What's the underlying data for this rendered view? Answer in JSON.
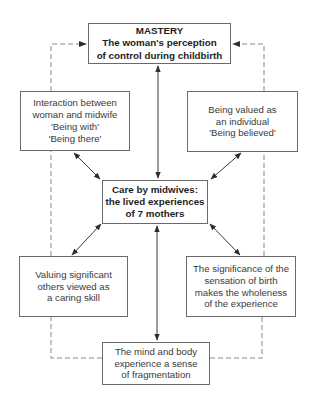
{
  "diagram": {
    "colors": {
      "box_border": "#6a6a6a",
      "solid_arrow": "#3a3a3a",
      "dashed_line": "#8a8a8a",
      "background": "#ffffff"
    },
    "nodes": {
      "mastery": {
        "lines": [
          "MASTERY",
          "The woman's perception",
          "of control during childbirth"
        ],
        "bold": true
      },
      "interaction": {
        "lines": [
          "Interaction between",
          "woman and midwife",
          "'Being with'",
          "'Being there'"
        ]
      },
      "valued": {
        "lines": [
          "Being valued as",
          "an individual",
          "'Being believed'"
        ]
      },
      "care": {
        "lines": [
          "Care by midwives:",
          "the lived experiences",
          "of 7 mothers"
        ],
        "bold": true
      },
      "significant_others": {
        "lines": [
          "Valuing significant",
          "others viewed as",
          "a caring skill"
        ]
      },
      "sensation": {
        "lines": [
          "The significance of the",
          "sensation of birth",
          "makes the wholeness",
          "of the experience"
        ]
      },
      "fragmentation": {
        "lines": [
          "The mind and body",
          "experience a sense",
          "of fragmentation"
        ]
      }
    },
    "edges": [
      {
        "from": "care",
        "to": "mastery",
        "style": "solid",
        "arrows": "both"
      },
      {
        "from": "care",
        "to": "fragmentation",
        "style": "solid",
        "arrows": "both"
      },
      {
        "from": "care",
        "to": "interaction",
        "style": "solid",
        "arrows": "both"
      },
      {
        "from": "care",
        "to": "valued",
        "style": "solid",
        "arrows": "both"
      },
      {
        "from": "care",
        "to": "significant_others",
        "style": "solid",
        "arrows": "both"
      },
      {
        "from": "care",
        "to": "sensation",
        "style": "solid",
        "arrows": "both"
      },
      {
        "from": "fragmentation",
        "to": "mastery",
        "via": "left",
        "style": "dashed",
        "arrows": "end"
      },
      {
        "from": "fragmentation",
        "to": "mastery",
        "via": "right",
        "style": "dashed",
        "arrows": "end"
      }
    ]
  }
}
